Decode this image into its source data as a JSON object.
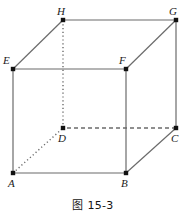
{
  "figure": {
    "caption": "图 15-3",
    "shape": "cube",
    "stroke_color": "#6b6b6b",
    "vertex_color": "#111111",
    "label_color": "#1a1a1a",
    "background": "#ffffff"
  },
  "vertices": [
    {
      "id": "A",
      "label": "A",
      "x": 13,
      "y": 173,
      "label_x": 8,
      "label_y": 178
    },
    {
      "id": "B",
      "label": "B",
      "x": 126,
      "y": 173,
      "label_x": 121,
      "label_y": 178
    },
    {
      "id": "C",
      "label": "C",
      "x": 176,
      "y": 128,
      "label_x": 171,
      "label_y": 133
    },
    {
      "id": "D",
      "label": "D",
      "x": 63,
      "y": 128,
      "label_x": 58,
      "label_y": 133
    },
    {
      "id": "E",
      "label": "E",
      "x": 13,
      "y": 69,
      "label_x": 3,
      "label_y": 55
    },
    {
      "id": "F",
      "label": "F",
      "x": 126,
      "y": 69,
      "label_x": 119,
      "label_y": 55
    },
    {
      "id": "G",
      "label": "G",
      "x": 176,
      "y": 20,
      "label_x": 169,
      "label_y": 6
    },
    {
      "id": "H",
      "label": "H",
      "x": 63,
      "y": 20,
      "label_x": 57,
      "label_y": 6
    }
  ],
  "edges": [
    {
      "from": "A",
      "to": "B",
      "style": "solid",
      "name": "edge-a-b"
    },
    {
      "from": "B",
      "to": "F",
      "style": "solid",
      "name": "edge-b-f"
    },
    {
      "from": "F",
      "to": "E",
      "style": "solid",
      "name": "edge-f-e"
    },
    {
      "from": "E",
      "to": "A",
      "style": "solid",
      "name": "edge-e-a"
    },
    {
      "from": "H",
      "to": "G",
      "style": "solid",
      "name": "edge-h-g"
    },
    {
      "from": "G",
      "to": "C",
      "style": "solid",
      "name": "edge-g-c"
    },
    {
      "from": "C",
      "to": "D",
      "style": "dashed",
      "name": "edge-c-d"
    },
    {
      "from": "D",
      "to": "H",
      "style": "dotted",
      "name": "edge-d-h"
    },
    {
      "from": "E",
      "to": "H",
      "style": "solid",
      "name": "edge-e-h"
    },
    {
      "from": "F",
      "to": "G",
      "style": "solid",
      "name": "edge-f-g"
    },
    {
      "from": "B",
      "to": "C",
      "style": "solid",
      "name": "edge-b-c"
    },
    {
      "from": "A",
      "to": "D",
      "style": "dotted",
      "name": "edge-a-d"
    }
  ]
}
